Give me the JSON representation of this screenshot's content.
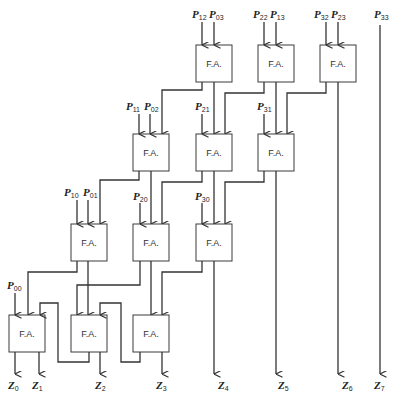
{
  "diagram": {
    "block_label": "F.A.",
    "rows": [
      {
        "name": "row-1",
        "adders": [
          {
            "id": "fa-1-1",
            "inputs": [
              "P12",
              "P03"
            ]
          },
          {
            "id": "fa-1-2",
            "inputs": [
              "P22",
              "P13"
            ]
          },
          {
            "id": "fa-1-3",
            "inputs": [
              "P32",
              "P23"
            ]
          }
        ]
      },
      {
        "name": "row-2",
        "adders": [
          {
            "id": "fa-2-1",
            "inputs": [
              "P11",
              "P02"
            ]
          },
          {
            "id": "fa-2-2",
            "inputs": [
              "P21"
            ]
          },
          {
            "id": "fa-2-3",
            "inputs": [
              "P31"
            ]
          }
        ]
      },
      {
        "name": "row-3",
        "adders": [
          {
            "id": "fa-3-1",
            "inputs": [
              "P10",
              "P01"
            ]
          },
          {
            "id": "fa-3-2",
            "inputs": [
              "P20"
            ]
          },
          {
            "id": "fa-3-3",
            "inputs": [
              "P30"
            ]
          }
        ]
      },
      {
        "name": "row-4",
        "adders": [
          {
            "id": "fa-4-1",
            "inputs": [
              "P00"
            ]
          },
          {
            "id": "fa-4-2",
            "inputs": []
          },
          {
            "id": "fa-4-3",
            "inputs": []
          }
        ]
      }
    ],
    "passthrough_input": "P33",
    "inputs": {
      "P12": {
        "base": "P",
        "sub": "12"
      },
      "P03": {
        "base": "P",
        "sub": "03"
      },
      "P22": {
        "base": "P",
        "sub": "22"
      },
      "P13": {
        "base": "P",
        "sub": "13"
      },
      "P32": {
        "base": "P",
        "sub": "32"
      },
      "P23": {
        "base": "P",
        "sub": "23"
      },
      "P33": {
        "base": "P",
        "sub": "33"
      },
      "P11": {
        "base": "P",
        "sub": "11"
      },
      "P02": {
        "base": "P",
        "sub": "02"
      },
      "P21": {
        "base": "P",
        "sub": "21"
      },
      "P31": {
        "base": "P",
        "sub": "31"
      },
      "P10": {
        "base": "P",
        "sub": "10"
      },
      "P01": {
        "base": "P",
        "sub": "01"
      },
      "P20": {
        "base": "P",
        "sub": "20"
      },
      "P30": {
        "base": "P",
        "sub": "30"
      },
      "P00": {
        "base": "P",
        "sub": "00"
      }
    },
    "outputs": [
      {
        "base": "Z",
        "sub": "0"
      },
      {
        "base": "Z",
        "sub": "1"
      },
      {
        "base": "Z",
        "sub": "2"
      },
      {
        "base": "Z",
        "sub": "3"
      },
      {
        "base": "Z",
        "sub": "4"
      },
      {
        "base": "Z",
        "sub": "5"
      },
      {
        "base": "Z",
        "sub": "6"
      },
      {
        "base": "Z",
        "sub": "7"
      }
    ],
    "colors": {
      "line": "#333333",
      "box_fill": "#ffffff",
      "background": "#ffffff"
    }
  }
}
